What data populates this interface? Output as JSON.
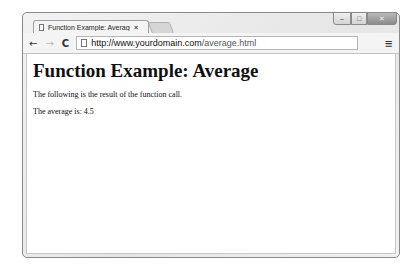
{
  "browser": {
    "tab": {
      "title": "Function Example: Average",
      "close_label": "×",
      "icon": "document-icon"
    },
    "window_controls": {
      "minimize": "–",
      "maximize": "□",
      "close": "✕"
    },
    "toolbar": {
      "back_icon": "←",
      "forward_icon": "→",
      "reload_icon": "C",
      "url_scheme_host": "http://www.yourdomain.com",
      "url_path": "/average.html",
      "menu_icon": "≡"
    }
  },
  "page": {
    "heading": "Function Example: Average",
    "paragraphs": [
      "The following is the result of the function call.",
      "The average is: 4.5"
    ]
  }
}
